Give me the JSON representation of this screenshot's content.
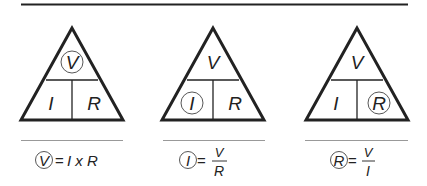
{
  "diagram": {
    "colors": {
      "stroke": "#222222",
      "thin_line": "#888888",
      "background": "#ffffff"
    },
    "triangles": [
      {
        "top": "V",
        "bottom_left": "I",
        "bottom_right": "R",
        "circled": "V",
        "formula": {
          "lhs": "V",
          "eq": "=",
          "rhs": "I x R"
        }
      },
      {
        "top": "V",
        "bottom_left": "I",
        "bottom_right": "R",
        "circled": "I",
        "formula": {
          "lhs": "I",
          "eq": "=",
          "numerator": "V",
          "denominator": "R"
        }
      },
      {
        "top": "V",
        "bottom_left": "I",
        "bottom_right": "R",
        "circled": "R",
        "formula": {
          "lhs": "R",
          "eq": "=",
          "numerator": "V",
          "denominator": "I"
        }
      }
    ]
  }
}
